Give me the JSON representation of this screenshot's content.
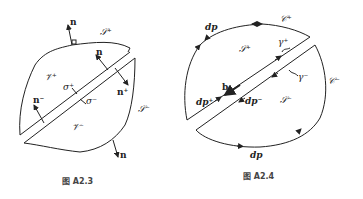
{
  "figures": [
    {
      "id": "A2.3",
      "caption": "图  A2.3",
      "labels": {
        "n_top": "n",
        "S_plus": "𝒮⁺",
        "n_cut": "n",
        "V_plus": "𝒱⁺",
        "sigma_plus": "σ⁺",
        "n_plus": "n⁺",
        "n_minus": "n⁻",
        "sigma_minus": "σ⁻",
        "S_minus": "𝒮⁻",
        "V_minus": "𝒱⁻",
        "n_bottom": "n"
      }
    },
    {
      "id": "A2.4",
      "caption": "图  A2.4",
      "labels": {
        "dp_top": "dp",
        "C_plus": "𝒞⁺",
        "S_plus": "𝒮⁺",
        "gamma_plus": "γ⁺",
        "gamma_minus": "γ⁻",
        "C_minus": "𝒞⁻",
        "b": "b",
        "dp_plus": "dp⁺",
        "dp_minus": "dp⁻",
        "S_minus": "𝒮⁻",
        "dp_bottom": "dp"
      }
    }
  ]
}
